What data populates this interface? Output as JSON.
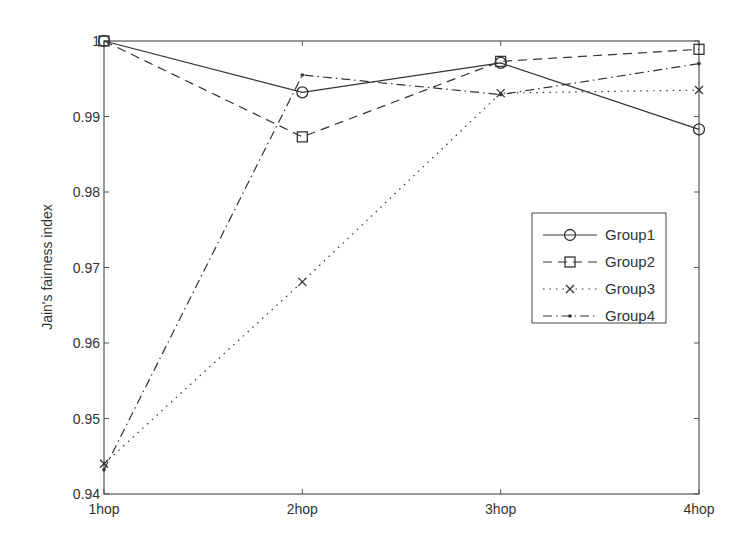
{
  "chart_data": {
    "type": "line",
    "title": "",
    "xlabel": "",
    "ylabel": "Jain's fairness index",
    "categories": [
      "1hop",
      "2hop",
      "3hop",
      "4hop"
    ],
    "ylim": [
      0.94,
      1.0
    ],
    "yticks": [
      0.94,
      0.95,
      0.96,
      0.97,
      0.98,
      0.99,
      1.0
    ],
    "ytick_labels": [
      "0.94",
      "0.95",
      "0.96",
      "0.97",
      "0.98",
      "0.99",
      "1"
    ],
    "grid": false,
    "legend_position": "center-right (inside plot)",
    "series": [
      {
        "name": "Group1",
        "marker": "circle",
        "linestyle": "solid",
        "values": [
          1.0,
          0.9932,
          0.9971,
          0.9883
        ]
      },
      {
        "name": "Group2",
        "marker": "square",
        "linestyle": "dashed",
        "values": [
          1.0,
          0.9873,
          0.9973,
          0.9989
        ]
      },
      {
        "name": "Group3",
        "marker": "x",
        "linestyle": "dotted",
        "values": [
          0.944,
          0.9681,
          0.9931,
          0.9935
        ]
      },
      {
        "name": "Group4",
        "marker": "point",
        "linestyle": "dashdot",
        "values": [
          0.9432,
          0.9955,
          0.9929,
          0.997
        ]
      }
    ]
  },
  "colors": {
    "line": "#333333",
    "axis": "#555555",
    "background": "#ffffff"
  }
}
